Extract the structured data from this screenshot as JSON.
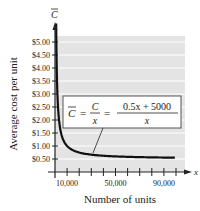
{
  "chart_data": {
    "type": "line",
    "title": "",
    "xlabel": "Number of units",
    "ylabel": "Average cost per unit",
    "x_axis_symbol": "x",
    "y_axis_symbol": "C̄",
    "xlim": [
      0,
      100000
    ],
    "ylim": [
      0,
      5.25
    ],
    "x_tick_labels": [
      "10,000",
      "50,000",
      "90,000"
    ],
    "x_tick_values": [
      10000,
      20000,
      30000,
      40000,
      50000,
      60000,
      70000,
      80000,
      90000,
      100000
    ],
    "y_tick_labels": [
      "$5.00",
      "$4.50",
      "$4.00",
      "$3.50",
      "$3.00",
      "$2.50",
      "$2.00",
      "$1.50",
      "$1.00",
      "$0.50"
    ],
    "y_tick_values": [
      5.0,
      4.5,
      4.0,
      3.5,
      3.0,
      2.5,
      2.0,
      1.5,
      1.0,
      0.5
    ],
    "grid": true,
    "series": [
      {
        "name": "C̄ = C/x = (0.5x + 5000)/x",
        "function": "(0.5x+5000)/x",
        "x": [
          1000,
          2000,
          5000,
          10000,
          20000,
          50000,
          100000
        ],
        "values": [
          5.5,
          3.0,
          1.5,
          1.0,
          0.75,
          0.6,
          0.55
        ]
      }
    ],
    "annotation": {
      "lhs": "C̄",
      "mid_num": "C",
      "mid_den": "x",
      "rhs_num": "0.5x + 5000",
      "rhs_den": "x",
      "eq": "="
    },
    "colors": {
      "plot_bg": "#e4e4e4",
      "grid": "#ffffff",
      "curve": "#111111",
      "axis": "#222222"
    }
  }
}
